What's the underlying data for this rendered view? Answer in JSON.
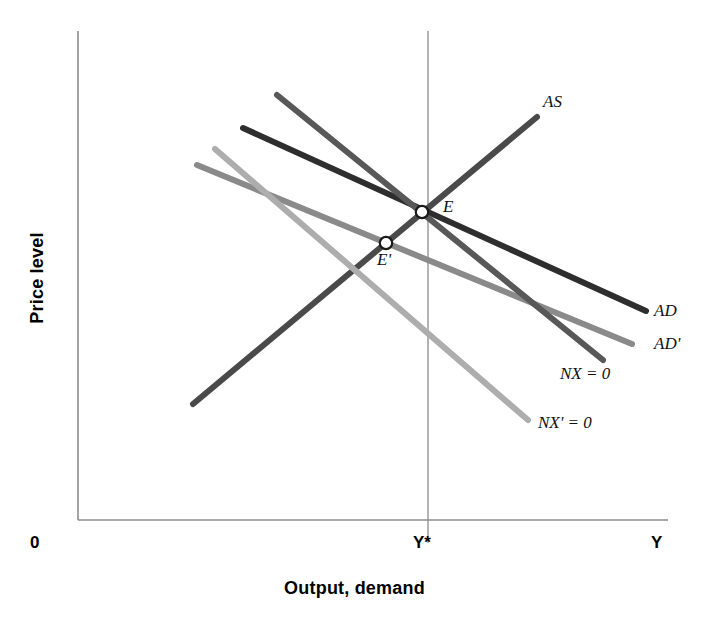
{
  "figure": {
    "background": "#ffffff",
    "axis_color": "#8c8c8c"
  },
  "axes": {
    "y_title": "Price level",
    "x_title": "Output, demand",
    "origin_label": "0",
    "x_end_label": "Y",
    "x_tick_label": "Y*"
  },
  "labels": {
    "as": "AS",
    "ad": "AD",
    "ad_prime": "AD'",
    "nx": "NX = 0",
    "nx_prime": "NX' = 0",
    "equilibrium": "E",
    "equilibrium_prime": "E'"
  },
  "chart_data": {
    "type": "line",
    "title": "",
    "xlabel": "Output, demand",
    "ylabel": "Price level",
    "grid": false,
    "legend": "inline-right",
    "axis_ranges": {
      "x_axis_pixels": [
        78,
        668
      ],
      "y_axis_pixels": [
        31,
        520
      ],
      "y_star_x_pixel": 428
    },
    "annotations": [
      {
        "name": "E",
        "label": "E",
        "x": 422,
        "y": 212,
        "marker": "open-circle",
        "description": "initial equilibrium where AS, AD and NX = 0 intersect"
      },
      {
        "name": "E-prime",
        "label": "E'",
        "x": 386,
        "y": 243,
        "marker": "open-circle",
        "description": "new equilibrium where AD' and NX' = 0 intersect"
      }
    ],
    "series": [
      {
        "name": "AS",
        "label": "AS",
        "color": "#4a4a4a",
        "width": 6,
        "slope": "upward",
        "points": [
          [
            193,
            404
          ],
          [
            537,
            117
          ]
        ]
      },
      {
        "name": "AD",
        "label": "AD",
        "color": "#2e2e2e",
        "width": 6,
        "slope": "downward",
        "points": [
          [
            243,
            128
          ],
          [
            646,
            311
          ]
        ]
      },
      {
        "name": "AD'",
        "label": "AD'",
        "color": "#8a8a8a",
        "width": 6,
        "slope": "downward",
        "points": [
          [
            197,
            165
          ],
          [
            632,
            344
          ]
        ]
      },
      {
        "name": "NX = 0",
        "label": "NX = 0",
        "color": "#585858",
        "width": 6,
        "slope": "downward-steep",
        "points": [
          [
            277,
            95
          ],
          [
            603,
            360
          ]
        ]
      },
      {
        "name": "NX' = 0",
        "label": "NX' = 0",
        "color": "#adadad",
        "width": 6,
        "slope": "downward-steep",
        "points": [
          [
            215,
            149
          ],
          [
            528,
            420
          ]
        ]
      }
    ]
  }
}
